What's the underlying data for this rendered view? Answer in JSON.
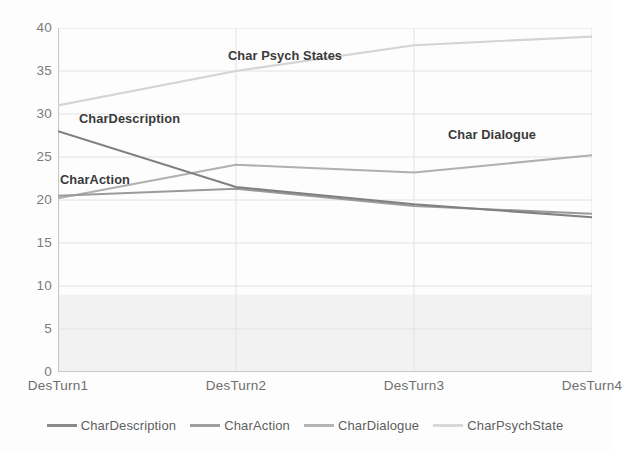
{
  "chart_data": {
    "type": "line",
    "title": "",
    "xlabel": "",
    "ylabel": "",
    "categories": [
      "DesTurn1",
      "DesTurn2",
      "DesTurn3",
      "DesTurn4"
    ],
    "ylim": [
      0,
      40
    ],
    "yticks": [
      0,
      5,
      10,
      15,
      20,
      25,
      30,
      35,
      40
    ],
    "grid": true,
    "legend_position": "bottom",
    "series": [
      {
        "name": "CharDescription",
        "values": [
          28,
          21.5,
          19.5,
          18
        ],
        "color": "#808080"
      },
      {
        "name": "CharAction",
        "values": [
          20.5,
          21.3,
          19.3,
          18.4
        ],
        "color": "#9a9a9a"
      },
      {
        "name": "CharDialogue",
        "values": [
          20.2,
          24.1,
          23.2,
          25.2
        ],
        "color": "#b0b0b0"
      },
      {
        "name": "CharPsychState",
        "values": [
          31,
          35,
          38,
          39
        ],
        "color": "#d4d4d4"
      }
    ],
    "annotations": [
      {
        "text": "Char Psych States",
        "x_px": 228,
        "y_px": 50
      },
      {
        "text": "CharDescription",
        "x_px": 79,
        "y_px": 113
      },
      {
        "text": "CharAction",
        "x_px": 60,
        "y_px": 174
      },
      {
        "text": "Char Dialogue",
        "x_px": 448,
        "y_px": 129
      }
    ],
    "shaded_band": {
      "from": 0,
      "to": 9,
      "color": "#f2f2f2"
    }
  },
  "legend": {
    "items": [
      {
        "label": "CharDescription",
        "color": "#8a8a8a"
      },
      {
        "label": "CharAction",
        "color": "#9f9f9f"
      },
      {
        "label": "CharDialogue",
        "color": "#b4b4b4"
      },
      {
        "label": "CharPsychState",
        "color": "#d8d8d8"
      }
    ]
  },
  "axis": {
    "y_tick_labels": [
      "40",
      "35",
      "30",
      "25",
      "20",
      "15",
      "10",
      "5",
      "0"
    ],
    "x_tick_labels": [
      "DesTurn1",
      "DesTurn2",
      "DesTurn3",
      "DesTurn4"
    ]
  },
  "colors": {
    "background": "#fdfdfd",
    "axis_line": "#c8c8c8",
    "gridline": "#e2e2e2",
    "tick_text": "#7b7b7b",
    "annotation_text": "#3a3a3a"
  }
}
